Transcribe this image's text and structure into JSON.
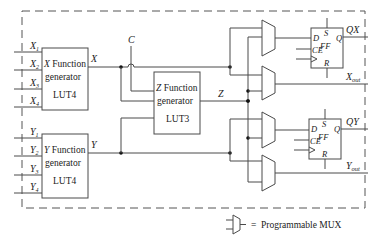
{
  "diagram": {
    "type": "CLB logic block",
    "blocks": {
      "x_fg": {
        "line1_var": "X",
        "line1_rest": " Function",
        "line2": "generator",
        "line3": "LUT4"
      },
      "z_fg": {
        "line1_var": "Z",
        "line1_rest": " Function",
        "line2": "generator",
        "line3": "LUT3"
      },
      "y_fg": {
        "line1_var": "Y",
        "line1_rest": " Function",
        "line2": "generator",
        "line3": "LUT4"
      },
      "ff_x": {
        "d": "D",
        "s": "S",
        "q": "Q",
        "ff": "FF",
        "ce": "CE",
        "r": "R"
      },
      "ff_y": {
        "d": "D",
        "s": "S",
        "q": "Q",
        "ff": "FF",
        "ce": "CE",
        "r": "R"
      }
    },
    "inputs_x": [
      "X",
      "X",
      "X",
      "X"
    ],
    "inputs_x_sub": [
      "1",
      "2",
      "3",
      "4"
    ],
    "inputs_y": [
      "Y",
      "Y",
      "Y",
      "Y"
    ],
    "inputs_y_sub": [
      "1",
      "2",
      "3",
      "4"
    ],
    "signals": {
      "x_out": "X",
      "y_out": "Y",
      "z_out": "Z",
      "c_in": "C"
    },
    "outputs": {
      "qx": "QX",
      "xout_main": "X",
      "xout_sub": "out",
      "qy": "QY",
      "yout_main": "Y",
      "yout_sub": "out"
    },
    "legend": {
      "equals": "=",
      "label": "Programmable MUX"
    }
  }
}
